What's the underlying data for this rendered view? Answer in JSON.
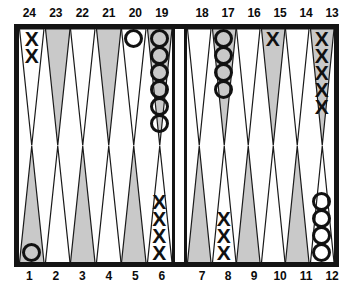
{
  "board": {
    "title": "Backgammon board position",
    "colors": {
      "frame": "#141414",
      "point_shaded": "#c9c9c9",
      "point_light": "#ffffff",
      "checker_outline": "#111111",
      "background": "#ffffff"
    },
    "checker_glyphs": {
      "x": "X",
      "o": ""
    },
    "top_labels_left": [
      "24",
      "23",
      "22",
      "21",
      "20",
      "19"
    ],
    "top_labels_right": [
      "18",
      "17",
      "16",
      "15",
      "14",
      "13"
    ],
    "bottom_labels_left": [
      "1",
      "2",
      "3",
      "4",
      "5",
      "6"
    ],
    "bottom_labels_right": [
      "7",
      "8",
      "9",
      "10",
      "11",
      "12"
    ],
    "quadrants": {
      "top_left": [
        {
          "point": "24",
          "shaded": false,
          "checker": "x",
          "count": 2
        },
        {
          "point": "23",
          "shaded": true,
          "checker": null,
          "count": 0
        },
        {
          "point": "22",
          "shaded": false,
          "checker": null,
          "count": 0
        },
        {
          "point": "21",
          "shaded": true,
          "checker": null,
          "count": 0
        },
        {
          "point": "20",
          "shaded": false,
          "checker": "o",
          "count": 1
        },
        {
          "point": "19",
          "shaded": true,
          "checker": "o",
          "count": 6
        }
      ],
      "top_right": [
        {
          "point": "18",
          "shaded": false,
          "checker": null,
          "count": 0
        },
        {
          "point": "17",
          "shaded": true,
          "checker": "o",
          "count": 4
        },
        {
          "point": "16",
          "shaded": false,
          "checker": null,
          "count": 0
        },
        {
          "point": "15",
          "shaded": true,
          "checker": "x",
          "count": 1
        },
        {
          "point": "14",
          "shaded": false,
          "checker": null,
          "count": 0
        },
        {
          "point": "13",
          "shaded": true,
          "checker": "x",
          "count": 5
        }
      ],
      "bottom_left": [
        {
          "point": "1",
          "shaded": true,
          "checker": "o",
          "count": 1
        },
        {
          "point": "2",
          "shaded": false,
          "checker": null,
          "count": 0
        },
        {
          "point": "3",
          "shaded": true,
          "checker": null,
          "count": 0
        },
        {
          "point": "4",
          "shaded": false,
          "checker": null,
          "count": 0
        },
        {
          "point": "5",
          "shaded": true,
          "checker": null,
          "count": 0
        },
        {
          "point": "6",
          "shaded": false,
          "checker": "x",
          "count": 4
        }
      ],
      "bottom_right": [
        {
          "point": "7",
          "shaded": true,
          "checker": null,
          "count": 0
        },
        {
          "point": "8",
          "shaded": false,
          "checker": "x",
          "count": 3
        },
        {
          "point": "9",
          "shaded": true,
          "checker": null,
          "count": 0
        },
        {
          "point": "10",
          "shaded": false,
          "checker": null,
          "count": 0
        },
        {
          "point": "11",
          "shaded": true,
          "checker": null,
          "count": 0
        },
        {
          "point": "12",
          "shaded": false,
          "checker": "o",
          "count": 4
        }
      ]
    }
  }
}
